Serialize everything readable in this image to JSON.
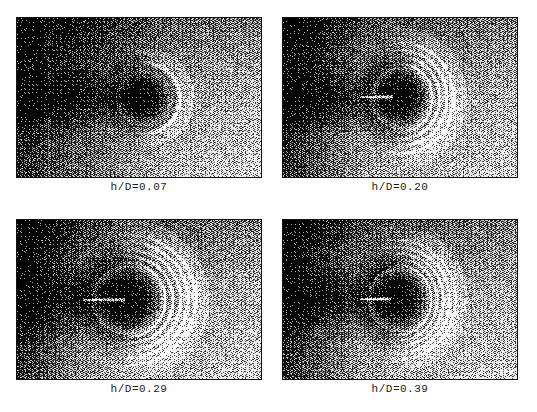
{
  "figure": {
    "type": "shadowgraph-photo-grid",
    "background_color": "#ffffff",
    "width": 537,
    "height": 412,
    "columns": 2,
    "rows": 2,
    "caption_font": "monospace",
    "caption_color": "#1a1a1a"
  },
  "panels": [
    {
      "id": "panel-top-left",
      "caption": "h/D=0.07",
      "position": {
        "x": 16,
        "y": 17,
        "width": 246,
        "height": 161
      },
      "caption_y": 181,
      "image": {
        "kind": "schlieren-shadowgraph",
        "description": "Dark field with faint vertical streak at left; small dark blunt body near center with a single thin bright crescent shock arc on its right side; bright speckled far-field to the right.",
        "seed": 1307,
        "body": {
          "cx": 0.52,
          "cy": 0.5,
          "rx": 0.115,
          "ry": 0.175
        },
        "arcs": 1,
        "arc_gap": 0.03,
        "arc_start": 0.145,
        "arc_brightness": 0.8,
        "needle": {
          "show": false,
          "x0": 0.0,
          "x1": 0.0,
          "y": 0.5
        },
        "dark_left": 0.6,
        "vertical_streak_x": 0.125,
        "base_dark": 0.3,
        "base_light": 0.8,
        "halo": 0.18
      }
    },
    {
      "id": "panel-top-right",
      "caption": "h/D=0.20",
      "position": {
        "x": 282,
        "y": 17,
        "width": 236,
        "height": 161
      },
      "caption_y": 181,
      "image": {
        "kind": "schlieren-shadowgraph",
        "description": "Dark elliptical body centered; three to four bright concentric shock arcs wrapping its right flank; bright horizontal needle pointing left from the body; mottled bright speckle above and below.",
        "seed": 2741,
        "body": {
          "cx": 0.5,
          "cy": 0.5,
          "rx": 0.125,
          "ry": 0.195
        },
        "arcs": 4,
        "arc_gap": 0.03,
        "arc_start": 0.135,
        "arc_brightness": 0.92,
        "needle": {
          "show": true,
          "x0": 0.33,
          "x1": 0.47,
          "y": 0.495
        },
        "dark_left": 0.34,
        "vertical_streak_x": -1,
        "base_dark": 0.32,
        "base_light": 0.78,
        "halo": 0.26
      }
    },
    {
      "id": "panel-bottom-left",
      "caption": "h/D=0.29",
      "position": {
        "x": 16,
        "y": 219,
        "width": 246,
        "height": 161
      },
      "caption_y": 383,
      "image": {
        "kind": "schlieren-shadowgraph",
        "description": "Large dark round body slightly left of center; four to five well separated bright concentric shock arcs on the right; prominent bright horizontal needle entering from the left into the body; broad dark wake extending left.",
        "seed": 5519,
        "body": {
          "cx": 0.45,
          "cy": 0.5,
          "rx": 0.145,
          "ry": 0.215
        },
        "arcs": 5,
        "arc_gap": 0.031,
        "arc_start": 0.155,
        "arc_brightness": 0.95,
        "needle": {
          "show": true,
          "x0": 0.27,
          "x1": 0.44,
          "y": 0.5
        },
        "dark_left": 0.3,
        "vertical_streak_x": -1,
        "base_dark": 0.3,
        "base_light": 0.8,
        "halo": 0.3
      }
    },
    {
      "id": "panel-bottom-right",
      "caption": "h/D=0.39",
      "position": {
        "x": 282,
        "y": 219,
        "width": 236,
        "height": 161
      },
      "caption_y": 383,
      "image": {
        "kind": "schlieren-shadowgraph",
        "description": "Dark elongated body near center; five tightly packed bright concentric shock arcs hugging the right side; short bright horizontal needle on the left of the body; strong bright speckle ring surrounding the dark core.",
        "seed": 8863,
        "body": {
          "cx": 0.49,
          "cy": 0.5,
          "rx": 0.13,
          "ry": 0.2
        },
        "arcs": 5,
        "arc_gap": 0.026,
        "arc_start": 0.14,
        "arc_brightness": 0.93,
        "needle": {
          "show": true,
          "x0": 0.33,
          "x1": 0.46,
          "y": 0.495
        },
        "dark_left": 0.32,
        "vertical_streak_x": -1,
        "base_dark": 0.31,
        "base_light": 0.79,
        "halo": 0.28
      }
    }
  ]
}
